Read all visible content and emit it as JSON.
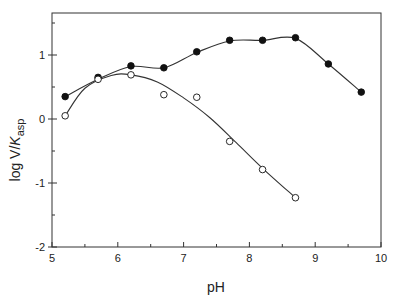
{
  "chart_data": {
    "type": "scatter",
    "title": "",
    "xlabel": "pH",
    "ylabel": "log V/Kasp",
    "ylabel_parts": {
      "main": "log V/",
      "italic": "K",
      "sub": "asp"
    },
    "xlim": [
      5,
      10
    ],
    "ylim": [
      -2,
      1.65
    ],
    "x_ticks": [
      5,
      6,
      7,
      8,
      9,
      10
    ],
    "x_tick_labels": [
      "5",
      "6",
      "7",
      "8",
      "9",
      "10"
    ],
    "y_ticks": [
      -2,
      -1,
      0,
      1
    ],
    "y_tick_labels": [
      "-2",
      "-1",
      "0",
      "1"
    ],
    "grid": false,
    "legend": null,
    "series": [
      {
        "name": "filled",
        "marker": "filled-circle",
        "x": [
          5.2,
          5.7,
          6.2,
          6.7,
          7.2,
          7.7,
          8.2,
          8.7,
          9.2,
          9.7
        ],
        "y": [
          0.35,
          0.65,
          0.83,
          0.8,
          1.05,
          1.23,
          1.23,
          1.27,
          0.86,
          0.42
        ]
      },
      {
        "name": "open",
        "marker": "open-circle",
        "x": [
          5.2,
          5.7,
          6.2,
          6.7,
          7.2,
          7.7,
          8.2,
          8.7
        ],
        "y": [
          0.05,
          0.62,
          0.69,
          0.38,
          0.34,
          -0.35,
          -0.79,
          -1.23
        ]
      }
    ],
    "fit_curves": [
      {
        "series": "filled",
        "x": [
          5.2,
          5.7,
          6.2,
          6.7,
          7.2,
          7.7,
          8.2,
          8.7,
          9.2,
          9.7
        ],
        "y": [
          0.35,
          0.62,
          0.82,
          0.8,
          1.04,
          1.22,
          1.23,
          1.26,
          0.86,
          0.42
        ]
      },
      {
        "series": "open",
        "x": [
          5.2,
          5.5,
          5.9,
          6.2,
          6.6,
          7.0,
          7.4,
          7.8,
          8.2,
          8.7
        ],
        "y": [
          0.05,
          0.48,
          0.68,
          0.69,
          0.58,
          0.33,
          0.02,
          -0.37,
          -0.77,
          -1.23
        ]
      }
    ]
  }
}
